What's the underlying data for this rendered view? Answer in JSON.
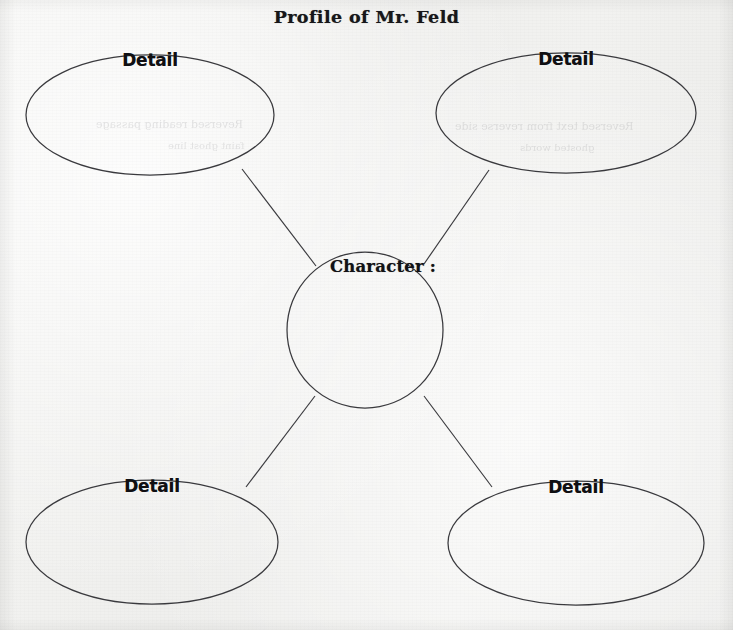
{
  "document": {
    "title": "Profile of Mr. Feld",
    "type": "character-profile-graphic-organizer",
    "paper_color": "#f1f1ef",
    "ink_color": "#2b2b2e"
  },
  "center": {
    "label": "Character :",
    "cx": 365,
    "cy": 330,
    "r": 78
  },
  "details": [
    {
      "id": "detail-top-left",
      "label": "Detail",
      "cx": 150,
      "cy": 115,
      "rx": 124,
      "ry": 60,
      "label_x": 150,
      "label_y": 50
    },
    {
      "id": "detail-top-right",
      "label": "Detail",
      "cx": 566,
      "cy": 113,
      "rx": 130,
      "ry": 60,
      "label_x": 566,
      "label_y": 49
    },
    {
      "id": "detail-bottom-left",
      "label": "Detail",
      "cx": 152,
      "cy": 542,
      "rx": 126,
      "ry": 62,
      "label_x": 152,
      "label_y": 476
    },
    {
      "id": "detail-bottom-right",
      "label": "Detail",
      "cx": 576,
      "cy": 543,
      "rx": 128,
      "ry": 62,
      "label_x": 576,
      "label_y": 477
    }
  ],
  "connectors": [
    {
      "id": "connector-top-left",
      "x1": 242,
      "y1": 169,
      "x2": 316,
      "y2": 266
    },
    {
      "id": "connector-top-right",
      "x1": 489,
      "y1": 170,
      "x2": 424,
      "y2": 264
    },
    {
      "id": "connector-bottom-left",
      "x1": 246,
      "y1": 487,
      "x2": 315,
      "y2": 396
    },
    {
      "id": "connector-bottom-right",
      "x1": 492,
      "y1": 487,
      "x2": 424,
      "y2": 396
    }
  ],
  "bleed_through": [
    {
      "text": "Reversed reading passage",
      "x": 96,
      "y": 118,
      "size": 11
    },
    {
      "text": "faint ghost line",
      "x": 168,
      "y": 140,
      "size": 10
    },
    {
      "text": "Reversed text from reverse side",
      "x": 455,
      "y": 120,
      "size": 11
    },
    {
      "text": "ghosted words",
      "x": 520,
      "y": 142,
      "size": 10
    }
  ]
}
